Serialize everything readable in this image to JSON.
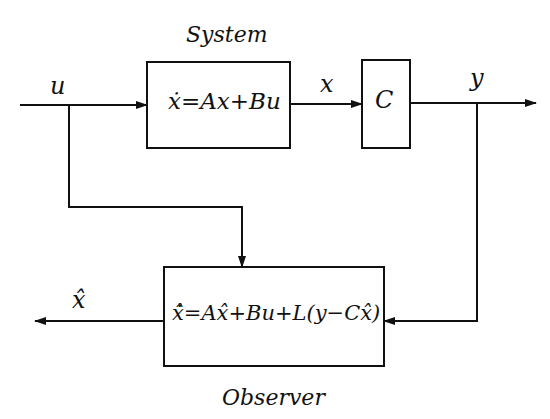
{
  "diagram": {
    "type": "block-diagram",
    "title_system": "System",
    "title_observer": "Observer",
    "blocks": [
      {
        "id": "system",
        "equation": "ẋ=Ax+Bu"
      },
      {
        "id": "output_matrix",
        "label": "C"
      },
      {
        "id": "observer",
        "equation": "x̂̇=Ax̂+Bu+L(y−Cx̂)"
      }
    ],
    "signals": {
      "input": "u",
      "state": "x",
      "output": "y",
      "estimate": "x̂"
    },
    "colors": {
      "line": "#111111",
      "background": "#ffffff"
    }
  }
}
